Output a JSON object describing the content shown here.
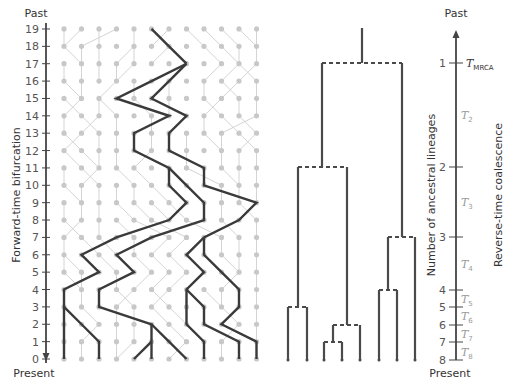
{
  "figure": {
    "width": 516,
    "height": 388,
    "colors": {
      "grid_dot": "#c8c8c8",
      "grid_line": "#d4d4d4",
      "lineage": "#3a3a3a",
      "axis": "#444444",
      "tree": "#4a4a4a",
      "t_label": "#9a9a9a"
    }
  },
  "left_axis": {
    "top_label": "Past",
    "bottom_label": "Present",
    "title": "Forward-time bifurcation",
    "ticks": [
      "0",
      "1",
      "2",
      "3",
      "4",
      "5",
      "6",
      "7",
      "8",
      "9",
      "10",
      "11",
      "12",
      "13",
      "14",
      "15",
      "16",
      "17",
      "18",
      "19"
    ],
    "x": 46,
    "y_row0": 359,
    "row_step": 17.37
  },
  "grid": {
    "columns": 12,
    "rows": 20,
    "x0": 64,
    "col_step": 17.5,
    "grey_links": [
      [
        19,
        0,
        18,
        0
      ],
      [
        19,
        1,
        18,
        0
      ],
      [
        19,
        2,
        18,
        2
      ],
      [
        19,
        3,
        18,
        1
      ],
      [
        19,
        4,
        18,
        4
      ],
      [
        19,
        6,
        18,
        5
      ],
      [
        19,
        7,
        18,
        8
      ],
      [
        19,
        8,
        18,
        9
      ],
      [
        19,
        9,
        18,
        10
      ],
      [
        19,
        10,
        18,
        11
      ],
      [
        19,
        11,
        18,
        11
      ],
      [
        18,
        0,
        17,
        1
      ],
      [
        18,
        1,
        17,
        1
      ],
      [
        18,
        2,
        17,
        2
      ],
      [
        18,
        4,
        17,
        3
      ],
      [
        18,
        4,
        17,
        4
      ],
      [
        18,
        6,
        17,
        5
      ],
      [
        18,
        8,
        17,
        9
      ],
      [
        18,
        9,
        17,
        10
      ],
      [
        18,
        10,
        17,
        10
      ],
      [
        18,
        11,
        17,
        11
      ],
      [
        17,
        0,
        16,
        0
      ],
      [
        17,
        1,
        16,
        1
      ],
      [
        17,
        2,
        16,
        2
      ],
      [
        17,
        3,
        16,
        3
      ],
      [
        17,
        4,
        16,
        3
      ],
      [
        17,
        9,
        16,
        8
      ],
      [
        17,
        10,
        16,
        9
      ],
      [
        17,
        10,
        16,
        11
      ],
      [
        17,
        11,
        16,
        10
      ],
      [
        16,
        0,
        15,
        1
      ],
      [
        16,
        1,
        15,
        1
      ],
      [
        16,
        3,
        15,
        2
      ],
      [
        16,
        4,
        15,
        4
      ],
      [
        16,
        6,
        15,
        6
      ],
      [
        16,
        8,
        15,
        8
      ],
      [
        16,
        9,
        15,
        10
      ],
      [
        16,
        10,
        15,
        9
      ],
      [
        16,
        11,
        15,
        11
      ],
      [
        15,
        0,
        14,
        1
      ],
      [
        15,
        1,
        14,
        0
      ],
      [
        15,
        2,
        14,
        2
      ],
      [
        15,
        2,
        14,
        3
      ],
      [
        15,
        4,
        14,
        5
      ],
      [
        15,
        6,
        14,
        6
      ],
      [
        15,
        8,
        14,
        9
      ],
      [
        15,
        9,
        14,
        8
      ],
      [
        15,
        10,
        14,
        10
      ],
      [
        15,
        11,
        14,
        11
      ],
      [
        14,
        0,
        13,
        0
      ],
      [
        14,
        1,
        13,
        2
      ],
      [
        14,
        2,
        13,
        1
      ],
      [
        14,
        3,
        13,
        3
      ],
      [
        14,
        5,
        13,
        5
      ],
      [
        14,
        8,
        13,
        8
      ],
      [
        14,
        9,
        13,
        10
      ],
      [
        14,
        10,
        13,
        11
      ],
      [
        14,
        11,
        13,
        9
      ],
      [
        13,
        0,
        12,
        1
      ],
      [
        13,
        1,
        12,
        0
      ],
      [
        13,
        2,
        12,
        2
      ],
      [
        13,
        3,
        12,
        3
      ],
      [
        13,
        5,
        12,
        5
      ],
      [
        13,
        7,
        12,
        7
      ],
      [
        13,
        8,
        12,
        9
      ],
      [
        13,
        9,
        12,
        9
      ],
      [
        13,
        10,
        12,
        11
      ],
      [
        13,
        11,
        12,
        10
      ],
      [
        12,
        0,
        11,
        1
      ],
      [
        12,
        1,
        11,
        2
      ],
      [
        12,
        2,
        11,
        2
      ],
      [
        12,
        3,
        11,
        3
      ],
      [
        12,
        5,
        11,
        4
      ],
      [
        12,
        7,
        11,
        7
      ],
      [
        12,
        9,
        11,
        9
      ],
      [
        12,
        10,
        11,
        10
      ],
      [
        12,
        11,
        11,
        11
      ],
      [
        11,
        0,
        10,
        0
      ],
      [
        11,
        1,
        10,
        2
      ],
      [
        11,
        2,
        10,
        1
      ],
      [
        11,
        3,
        10,
        4
      ],
      [
        11,
        4,
        10,
        5
      ],
      [
        11,
        7,
        10,
        9
      ],
      [
        11,
        9,
        10,
        10
      ],
      [
        11,
        10,
        10,
        10
      ],
      [
        11,
        11,
        10,
        11
      ],
      [
        10,
        0,
        9,
        1
      ],
      [
        10,
        1,
        9,
        1
      ],
      [
        10,
        2,
        9,
        2
      ],
      [
        10,
        3,
        9,
        3
      ],
      [
        10,
        4,
        9,
        4
      ],
      [
        10,
        5,
        9,
        6
      ],
      [
        10,
        9,
        9,
        9
      ],
      [
        10,
        10,
        9,
        10
      ],
      [
        10,
        11,
        9,
        11
      ],
      [
        9,
        0,
        8,
        0
      ],
      [
        9,
        1,
        8,
        1
      ],
      [
        9,
        2,
        8,
        2
      ],
      [
        9,
        3,
        8,
        4
      ],
      [
        9,
        4,
        8,
        5
      ],
      [
        9,
        5,
        8,
        6
      ],
      [
        9,
        6,
        8,
        7
      ],
      [
        9,
        9,
        8,
        9
      ],
      [
        9,
        10,
        8,
        11
      ],
      [
        8,
        0,
        7,
        1
      ],
      [
        8,
        1,
        7,
        0
      ],
      [
        8,
        2,
        7,
        2
      ],
      [
        8,
        3,
        7,
        4
      ],
      [
        8,
        4,
        7,
        6
      ],
      [
        8,
        5,
        7,
        7
      ],
      [
        8,
        7,
        7,
        9
      ],
      [
        8,
        9,
        7,
        10
      ],
      [
        8,
        11,
        7,
        11
      ],
      [
        7,
        0,
        6,
        0
      ],
      [
        7,
        1,
        6,
        2
      ],
      [
        7,
        2,
        6,
        3
      ],
      [
        7,
        4,
        6,
        4
      ],
      [
        7,
        6,
        6,
        5
      ],
      [
        7,
        7,
        6,
        6
      ],
      [
        7,
        9,
        6,
        9
      ],
      [
        7,
        10,
        6,
        10
      ],
      [
        7,
        11,
        6,
        11
      ],
      [
        6,
        0,
        5,
        0
      ],
      [
        6,
        0,
        5,
        1
      ],
      [
        6,
        2,
        5,
        3
      ],
      [
        6,
        4,
        5,
        5
      ],
      [
        6,
        5,
        5,
        6
      ],
      [
        6,
        6,
        5,
        7
      ],
      [
        6,
        9,
        5,
        10
      ],
      [
        6,
        10,
        5,
        10
      ],
      [
        6,
        11,
        5,
        11
      ],
      [
        5,
        0,
        4,
        1
      ],
      [
        5,
        1,
        4,
        1
      ],
      [
        5,
        3,
        4,
        3
      ],
      [
        5,
        5,
        4,
        4
      ],
      [
        5,
        6,
        4,
        5
      ],
      [
        5,
        7,
        4,
        6
      ],
      [
        5,
        10,
        4,
        9
      ],
      [
        5,
        11,
        4,
        11
      ],
      [
        4,
        1,
        3,
        1
      ],
      [
        4,
        3,
        3,
        4
      ],
      [
        4,
        4,
        3,
        3
      ],
      [
        4,
        5,
        3,
        6
      ],
      [
        4,
        6,
        3,
        5
      ],
      [
        4,
        8,
        3,
        9
      ],
      [
        4,
        9,
        3,
        9
      ],
      [
        4,
        11,
        3,
        11
      ],
      [
        3,
        1,
        2,
        2
      ],
      [
        3,
        3,
        2,
        3
      ],
      [
        3,
        4,
        2,
        4
      ],
      [
        3,
        5,
        2,
        6
      ],
      [
        3,
        6,
        2,
        7
      ],
      [
        3,
        9,
        2,
        10
      ],
      [
        3,
        11,
        2,
        11
      ],
      [
        2,
        2,
        1,
        1
      ],
      [
        2,
        3,
        1,
        3
      ],
      [
        2,
        4,
        1,
        4
      ],
      [
        2,
        6,
        1,
        7
      ],
      [
        2,
        10,
        1,
        9
      ],
      [
        2,
        11,
        1,
        11
      ],
      [
        1,
        1,
        0,
        1
      ],
      [
        1,
        3,
        0,
        3
      ],
      [
        1,
        4,
        0,
        3
      ],
      [
        1,
        7,
        0,
        6
      ],
      [
        1,
        9,
        0,
        9
      ]
    ]
  },
  "lineages": [
    [
      [
        19,
        5
      ],
      [
        18,
        6
      ],
      [
        17,
        7
      ]
    ],
    [
      [
        17,
        7
      ],
      [
        16,
        5
      ],
      [
        15,
        3
      ],
      [
        14,
        6
      ],
      [
        13,
        4
      ],
      [
        12,
        4
      ],
      [
        11,
        6
      ],
      [
        10,
        6
      ],
      [
        9,
        7
      ],
      [
        8,
        6
      ],
      [
        7,
        3
      ],
      [
        6,
        1
      ],
      [
        5,
        2
      ],
      [
        4,
        0
      ],
      [
        3,
        0
      ],
      [
        2,
        0
      ],
      [
        1,
        0
      ],
      [
        0,
        0
      ]
    ],
    [
      [
        3,
        0
      ],
      [
        2,
        1
      ],
      [
        1,
        2
      ],
      [
        0,
        2
      ]
    ],
    [
      [
        11,
        6
      ],
      [
        10,
        7
      ],
      [
        9,
        8
      ],
      [
        8,
        8
      ],
      [
        7,
        5
      ],
      [
        6,
        3
      ],
      [
        5,
        4
      ],
      [
        4,
        2
      ],
      [
        3,
        2
      ],
      [
        2,
        5
      ],
      [
        1,
        5
      ],
      [
        0,
        5
      ]
    ],
    [
      [
        1,
        5
      ],
      [
        0,
        4
      ]
    ],
    [
      [
        2,
        5
      ],
      [
        1,
        6
      ],
      [
        0,
        7
      ]
    ],
    [
      [
        17,
        7
      ],
      [
        16,
        6
      ],
      [
        15,
        5
      ],
      [
        14,
        7
      ],
      [
        13,
        6
      ],
      [
        12,
        6
      ],
      [
        11,
        8
      ],
      [
        10,
        8
      ],
      [
        9,
        11
      ],
      [
        8,
        10
      ],
      [
        7,
        8
      ],
      [
        6,
        7
      ],
      [
        5,
        8
      ],
      [
        4,
        7
      ],
      [
        3,
        7
      ],
      [
        2,
        7
      ],
      [
        1,
        8
      ],
      [
        0,
        8
      ]
    ],
    [
      [
        4,
        7
      ],
      [
        3,
        8
      ],
      [
        2,
        8
      ],
      [
        1,
        10
      ],
      [
        0,
        10
      ]
    ],
    [
      [
        7,
        8
      ],
      [
        6,
        8
      ],
      [
        5,
        9
      ],
      [
        4,
        10
      ],
      [
        3,
        10
      ],
      [
        2,
        9
      ],
      [
        1,
        11
      ],
      [
        0,
        11
      ]
    ]
  ],
  "tree": {
    "leaves_x": [
      288,
      307,
      324,
      342,
      360,
      379,
      397,
      415
    ],
    "leaf_y": 360,
    "root_stem": {
      "x": 362,
      "y_top": 28,
      "y_bottom": 63
    },
    "segments_solid": [
      [
        322,
        63,
        322,
        167
      ],
      [
        402,
        63,
        402,
        237
      ],
      [
        298,
        167,
        298,
        307
      ],
      [
        347,
        167,
        347,
        325
      ],
      [
        288,
        307,
        288,
        360
      ],
      [
        307,
        307,
        307,
        360
      ],
      [
        333,
        325,
        333,
        342
      ],
      [
        360,
        325,
        360,
        360
      ],
      [
        324,
        342,
        324,
        360
      ],
      [
        342,
        342,
        342,
        360
      ],
      [
        388,
        237,
        388,
        290
      ],
      [
        415,
        237,
        415,
        360
      ],
      [
        379,
        290,
        379,
        360
      ],
      [
        397,
        290,
        397,
        360
      ]
    ],
    "segments_dashed": [
      [
        322,
        63,
        402,
        63
      ],
      [
        298,
        167,
        347,
        167
      ],
      [
        388,
        237,
        415,
        237
      ],
      [
        379,
        290,
        397,
        290
      ],
      [
        288,
        307,
        307,
        307
      ],
      [
        333,
        325,
        360,
        325
      ],
      [
        324,
        342,
        342,
        342
      ]
    ]
  },
  "right_axis": {
    "top_label": "Past",
    "bottom_label": "Present",
    "title_left": "Number of ancestral lineages",
    "title_right": "Reverse-time coalescence",
    "x": 456,
    "y_top": 30,
    "y_bottom": 360,
    "ticks": [
      {
        "label": "1",
        "y": 63
      },
      {
        "label": "2",
        "y": 167
      },
      {
        "label": "3",
        "y": 237
      },
      {
        "label": "4",
        "y": 290
      },
      {
        "label": "5",
        "y": 307
      },
      {
        "label": "6",
        "y": 325
      },
      {
        "label": "7",
        "y": 342
      },
      {
        "label": "8",
        "y": 360
      }
    ],
    "intervals": [
      {
        "base": "T",
        "sub": "MRCA",
        "y": 63,
        "dark": true
      },
      {
        "base": "T",
        "sub": "2",
        "y": 115,
        "dark": false
      },
      {
        "base": "T",
        "sub": "3",
        "y": 202,
        "dark": false
      },
      {
        "base": "T",
        "sub": "4",
        "y": 264,
        "dark": false
      },
      {
        "base": "T",
        "sub": "5",
        "y": 299,
        "dark": false
      },
      {
        "base": "T",
        "sub": "6",
        "y": 316,
        "dark": false
      },
      {
        "base": "T",
        "sub": "7",
        "y": 334,
        "dark": false
      },
      {
        "base": "T",
        "sub": "8",
        "y": 352,
        "dark": false
      }
    ]
  }
}
